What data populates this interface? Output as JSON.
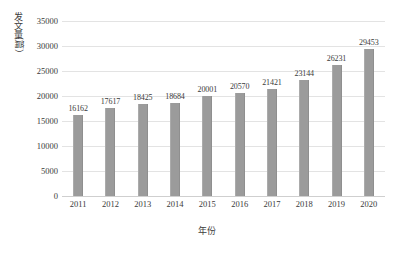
{
  "chart_data": {
    "type": "bar",
    "title": "",
    "subtitle": "",
    "xlabel": "年份",
    "ylabel": "发文量（篇）",
    "ylabel_chars": [
      "发",
      "文",
      "量"
    ],
    "ylabel_paren": "（篇）",
    "categories": [
      "2011",
      "2012",
      "2013",
      "2014",
      "2015",
      "2016",
      "2017",
      "2018",
      "2019",
      "2020"
    ],
    "values": [
      16162,
      17617,
      18425,
      18684,
      20001,
      20570,
      21421,
      23144,
      26231,
      29453
    ],
    "data_labels": [
      "16162",
      "17617",
      "18425",
      "18684",
      "20001",
      "20570",
      "21421",
      "23144",
      "26231",
      "29453"
    ],
    "series": [
      {
        "name": "发文量",
        "values": [
          16162,
          17617,
          18425,
          18684,
          20001,
          20570,
          21421,
          23144,
          26231,
          29453
        ]
      }
    ],
    "ylim": [
      0,
      35000
    ],
    "yticks": [
      0,
      5000,
      10000,
      15000,
      20000,
      25000,
      30000,
      35000
    ],
    "ytick_labels": [
      "0",
      "5000",
      "10000",
      "15000",
      "20000",
      "25000",
      "30000",
      "35000"
    ],
    "grid": true,
    "grid_axis": "y",
    "legend": false,
    "legend_position": "none",
    "bar_color": "#9b9b9b",
    "grid_color": "#e3e3e3",
    "text_color": "#3a3a3a",
    "background_color": "#ffffff"
  }
}
